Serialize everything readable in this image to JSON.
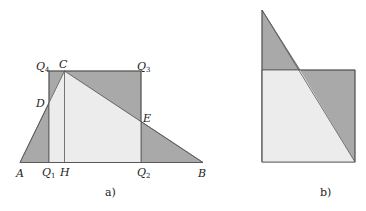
{
  "panel_a": {
    "caption": "a)",
    "labels": {
      "A": "A",
      "B": "B",
      "C": "C",
      "D": "D",
      "E": "E",
      "H": "H",
      "Q1": "Q",
      "Q1_sub": "1",
      "Q2": "Q",
      "Q2_sub": "2",
      "Q3": "Q",
      "Q3_sub": "3",
      "Q4": "Q",
      "Q4_sub": "4"
    }
  },
  "panel_b": {
    "caption": "b)"
  },
  "colors": {
    "dark_fill": "#a9a9a9",
    "light_fill": "#ececec",
    "stroke": "#555555"
  }
}
